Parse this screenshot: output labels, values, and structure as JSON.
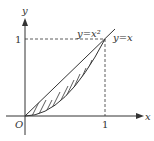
{
  "diagram": {
    "axes": {
      "x_label": "x",
      "y_label": "y",
      "origin_label": "O",
      "x_tick": "1",
      "y_tick": "1"
    },
    "curves": [
      {
        "name": "line",
        "label": "y=x"
      },
      {
        "name": "parabola",
        "label": "y=x²"
      }
    ],
    "shaded_region": "area between y=x and y=x² for 0≤x≤1",
    "colors": {
      "stroke": "#333333",
      "background": "#ffffff"
    }
  }
}
